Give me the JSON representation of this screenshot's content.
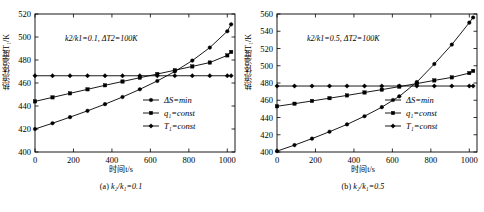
{
  "figure": {
    "panels": [
      {
        "caption_prefix": "(a)",
        "caption_expr": "k₂/k₁=0.1",
        "annotation": "k₂/k₁=0.1, ΔT₂=100K",
        "ylabel": "热流体温度T₁/K",
        "xlabel": "时间t/s"
      },
      {
        "caption_prefix": "(b)",
        "caption_expr": "k₂/k₁=0.5",
        "annotation": "k₂/k₁=0.5, ΔT₂=100K",
        "ylabel": "热流体温度T₁/K",
        "xlabel": "时间t/s"
      }
    ],
    "legend_labels": [
      "ΔS=min",
      "q₁=const",
      "T₁=const"
    ]
  },
  "chart_data": [
    {
      "type": "line",
      "title": "(a) k2/k1=0.1",
      "annotation": "k2/k1=0.1, ΔT2=100K",
      "xlabel": "时间t/s",
      "ylabel": "热流体温度T1/K",
      "xlim": [
        0,
        1040
      ],
      "ylim": [
        400,
        520
      ],
      "xticks": [
        0,
        200,
        400,
        600,
        800,
        1000
      ],
      "yticks": [
        400,
        420,
        440,
        460,
        480,
        500,
        520
      ],
      "grid": false,
      "legend_position": "center-right",
      "x": [
        0,
        91,
        182,
        273,
        364,
        455,
        545,
        636,
        727,
        818,
        909,
        1000,
        1020
      ],
      "series": [
        {
          "name": "ΔS=min",
          "marker": "circle",
          "values": [
            420.0,
            425.0,
            430.3,
            435.8,
            441.6,
            447.8,
            454.5,
            461.8,
            470.0,
            479.5,
            490.8,
            505.0,
            511.0
          ]
        },
        {
          "name": "q1=const",
          "marker": "square",
          "values": [
            444.0,
            447.5,
            451.0,
            454.5,
            458.0,
            461.3,
            464.6,
            467.8,
            471.1,
            474.4,
            477.8,
            484.0,
            487.0
          ]
        },
        {
          "name": "T1=const",
          "marker": "diamond",
          "values": [
            466.3,
            466.3,
            466.3,
            466.3,
            466.3,
            466.3,
            466.3,
            466.3,
            466.3,
            466.3,
            466.3,
            466.3,
            466.3
          ]
        }
      ]
    },
    {
      "type": "line",
      "title": "(b) k2/k1=0.5",
      "annotation": "k2/k1=0.5, ΔT2=100K",
      "xlabel": "时间t/s",
      "ylabel": "热流体温度T1/K",
      "xlim": [
        0,
        1040
      ],
      "ylim": [
        400,
        560
      ],
      "xticks": [
        0,
        200,
        400,
        600,
        800,
        1000
      ],
      "yticks": [
        400,
        420,
        440,
        460,
        480,
        500,
        520,
        540,
        560
      ],
      "grid": false,
      "legend_position": "center-right",
      "x": [
        0,
        91,
        182,
        273,
        364,
        455,
        545,
        636,
        727,
        818,
        909,
        1000,
        1020
      ],
      "series": [
        {
          "name": "ΔS=min",
          "marker": "circle",
          "values": [
            401.0,
            408.0,
            415.5,
            423.5,
            432.0,
            441.5,
            452.0,
            464.5,
            481.0,
            502.0,
            524.5,
            550.0,
            556.0
          ]
        },
        {
          "name": "q1=const",
          "marker": "square",
          "values": [
            453.0,
            456.0,
            459.2,
            462.4,
            465.6,
            469.0,
            472.3,
            475.8,
            479.3,
            483.0,
            486.5,
            491.5,
            494.0
          ]
        },
        {
          "name": "T1=const",
          "marker": "diamond",
          "values": [
            476.5,
            476.5,
            476.5,
            476.5,
            476.5,
            476.5,
            476.5,
            476.5,
            476.5,
            476.5,
            476.5,
            476.5,
            476.5
          ]
        }
      ]
    }
  ]
}
